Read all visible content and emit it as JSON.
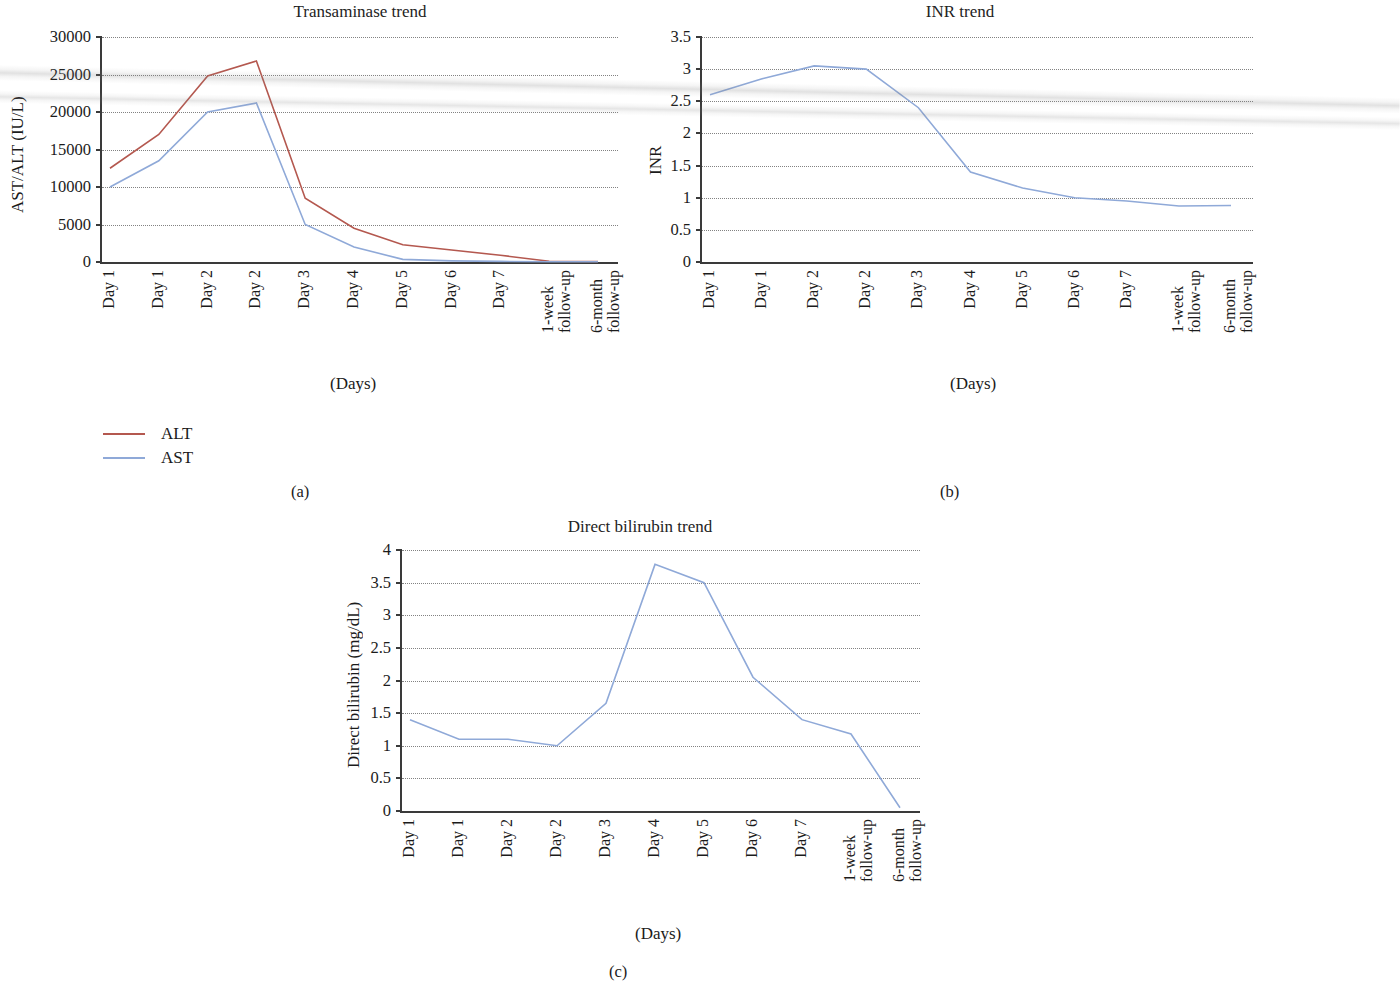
{
  "figure": {
    "background": "#ffffff",
    "colors": {
      "alt": "#b4584f",
      "ast": "#8fa9d8",
      "axis": "#3a3a3a",
      "grid": "#6d6d6d"
    }
  },
  "categories": [
    "Day 1",
    "Day 1",
    "Day 2",
    "Day 2",
    "Day 3",
    "Day 4",
    "Day 5",
    "Day 6",
    "Day 7",
    "1-week follow-up",
    "6-month follow-up"
  ],
  "xtick_lines": [
    [
      "Day 1",
      ""
    ],
    [
      "Day 1",
      ""
    ],
    [
      "Day 2",
      ""
    ],
    [
      "Day 2",
      ""
    ],
    [
      "Day 3",
      ""
    ],
    [
      "Day 4",
      ""
    ],
    [
      "Day 5",
      ""
    ],
    [
      "Day 6",
      ""
    ],
    [
      "Day 7",
      ""
    ],
    [
      "1-week",
      "follow-up"
    ],
    [
      "6-month",
      "follow-up"
    ]
  ],
  "panels": [
    {
      "id": "a",
      "caption": "(a)",
      "title": "Transaminase trend",
      "ylabel": "AST/ALT (IU/L)",
      "xcaption": "(Days)",
      "yticks": [
        "0",
        "5000",
        "10000",
        "15000",
        "20000",
        "25000",
        "30000"
      ],
      "legend": [
        {
          "label": "ALT",
          "color": "#b4584f"
        },
        {
          "label": "AST",
          "color": "#8fa9d8"
        }
      ]
    },
    {
      "id": "b",
      "caption": "(b)",
      "title": "INR trend",
      "ylabel": "INR",
      "xcaption": "(Days)",
      "yticks": [
        "0",
        "0.5",
        "1",
        "1.5",
        "2",
        "2.5",
        "3",
        "3.5"
      ]
    },
    {
      "id": "c",
      "caption": "(c)",
      "title": "Direct bilirubin trend",
      "ylabel": "Direct bilirubin (mg/dL)",
      "xcaption": "(Days)",
      "yticks": [
        "0",
        "0.5",
        "1",
        "1.5",
        "2",
        "2.5",
        "3",
        "3.5",
        "4"
      ]
    }
  ],
  "chart_data": [
    {
      "type": "line",
      "panel": "a",
      "title": "Transaminase trend",
      "xlabel": "(Days)",
      "ylabel": "AST/ALT (IU/L)",
      "ylim": [
        0,
        30000
      ],
      "ytick_step": 5000,
      "grid": true,
      "legend_position": "below-left",
      "categories": [
        "Day 1",
        "Day 1",
        "Day 2",
        "Day 2",
        "Day 3",
        "Day 4",
        "Day 5",
        "Day 6",
        "Day 7",
        "1-week follow-up",
        "6-month follow-up"
      ],
      "series": [
        {
          "name": "ALT",
          "color": "#b4584f",
          "values": [
            12500,
            17000,
            24800,
            26800,
            8500,
            4500,
            2300,
            1600,
            900,
            100,
            60
          ]
        },
        {
          "name": "AST",
          "color": "#8fa9d8",
          "values": [
            10000,
            13500,
            20000,
            21200,
            5000,
            2000,
            350,
            150,
            80,
            40,
            30
          ]
        }
      ]
    },
    {
      "type": "line",
      "panel": "b",
      "title": "INR trend",
      "xlabel": "(Days)",
      "ylabel": "INR",
      "ylim": [
        0,
        3.5
      ],
      "ytick_step": 0.5,
      "grid": true,
      "legend_position": "none",
      "categories": [
        "Day 1",
        "Day 1",
        "Day 2",
        "Day 2",
        "Day 3",
        "Day 4",
        "Day 5",
        "Day 6",
        "Day 7",
        "1-week follow-up",
        "6-month follow-up"
      ],
      "series": [
        {
          "name": "INR",
          "color": "#8fa9d8",
          "values": [
            2.6,
            2.85,
            3.05,
            3.0,
            2.4,
            1.4,
            1.15,
            1.0,
            0.95,
            0.87,
            0.88
          ]
        }
      ]
    },
    {
      "type": "line",
      "panel": "c",
      "title": "Direct bilirubin trend",
      "xlabel": "(Days)",
      "ylabel": "Direct bilirubin (mg/dL)",
      "ylim": [
        0,
        4
      ],
      "ytick_step": 0.5,
      "grid": true,
      "legend_position": "none",
      "categories": [
        "Day 1",
        "Day 1",
        "Day 2",
        "Day 2",
        "Day 3",
        "Day 4",
        "Day 5",
        "Day 6",
        "Day 7",
        "1-week follow-up",
        "6-month follow-up"
      ],
      "series": [
        {
          "name": "Direct bilirubin",
          "color": "#8fa9d8",
          "values": [
            1.4,
            1.1,
            1.1,
            1.0,
            1.65,
            3.78,
            3.5,
            2.05,
            1.4,
            1.18,
            0.05
          ]
        }
      ]
    }
  ]
}
